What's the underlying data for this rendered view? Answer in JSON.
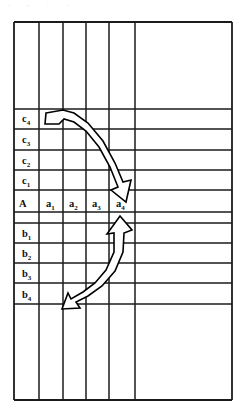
{
  "figure": {
    "title_artifact": ". , . .",
    "kind": "grid-table-diagram",
    "background": "#ffffff",
    "line_color": "#1b1b1b"
  },
  "grid": {
    "left": 14,
    "right": 232,
    "top": 22,
    "bottom": 400,
    "vertical_lines": [
      14,
      39,
      63,
      86,
      109,
      135,
      232
    ],
    "horizontal_lines": [
      22,
      109,
      129,
      150,
      170,
      190,
      212,
      223,
      243,
      263,
      283,
      304,
      400
    ],
    "column_count": 6,
    "row_count": 12
  },
  "header_row": {
    "name": "A",
    "y": 202,
    "columns": [
      {
        "label": "A",
        "base": "A",
        "sub": "",
        "x": 22,
        "name": "row-label-header-A"
      },
      {
        "label": "a1",
        "base": "a",
        "sub": "1",
        "x": 48,
        "name": "column-header-a1"
      },
      {
        "label": "a2",
        "base": "a",
        "sub": "2",
        "x": 71,
        "name": "column-header-a2"
      },
      {
        "label": "a3",
        "base": "a",
        "sub": "3",
        "x": 94,
        "name": "column-header-a3"
      },
      {
        "label": "a4",
        "base": "a",
        "sub": "4",
        "x": 118,
        "name": "column-header-a4"
      }
    ]
  },
  "upper_rows": [
    {
      "label": "c4",
      "base": "c",
      "sub": "4",
      "x": 22,
      "y": 122,
      "name": "row-label-c4"
    },
    {
      "label": "c3",
      "base": "c",
      "sub": "3",
      "x": 22,
      "y": 143,
      "name": "row-label-c3"
    },
    {
      "label": "c2",
      "base": "c",
      "sub": "2",
      "x": 22,
      "y": 164,
      "name": "row-label-c2"
    },
    {
      "label": "c1",
      "base": "c",
      "sub": "1",
      "x": 22,
      "y": 184,
      "name": "row-label-c1"
    }
  ],
  "lower_rows": [
    {
      "label": "b1",
      "base": "b",
      "sub": "1",
      "x": 22,
      "y": 237,
      "name": "row-label-b1"
    },
    {
      "label": "b2",
      "base": "b",
      "sub": "2",
      "x": 22,
      "y": 257,
      "name": "row-label-b2"
    },
    {
      "label": "b3",
      "base": "b",
      "sub": "3",
      "x": 22,
      "y": 277,
      "name": "row-label-b3"
    },
    {
      "label": "b4",
      "base": "b",
      "sub": "4",
      "x": 22,
      "y": 297,
      "name": "row-label-b4"
    }
  ],
  "arrows": [
    {
      "name": "arrow-c4-to-a4",
      "description": "double-headed curved arrow from c4 row toward a4 column",
      "from": "c4",
      "to": "a4",
      "double_headed": true,
      "outline": "M 46,113 L 63,110 L 74,113 L 88,123 L 103,141 L 115,163 L 123,182 L 131,180 L 126,202 L 111,190 L 118,187 L 110,167 L 99,147 L 86,131 L 74,122 L 64,119 L 59,124 L 45,124 Z"
    },
    {
      "name": "arrow-b4-to-a4",
      "description": "double-headed curved arrow from b4 row toward a4 column",
      "from": "b4",
      "to": "a4",
      "double_headed": true,
      "outline": "M 120,216 L 132,230 L 124,233 L 123,252 L 115,271 L 102,286 L 88,296 L 76,302 L 80,308 L 62,309 L 68,293 L 71,299 L 83,292 L 95,283 L 106,270 L 114,252 L 114,233 L 107,234 Z"
    }
  ],
  "legend": {
    "note": ""
  }
}
